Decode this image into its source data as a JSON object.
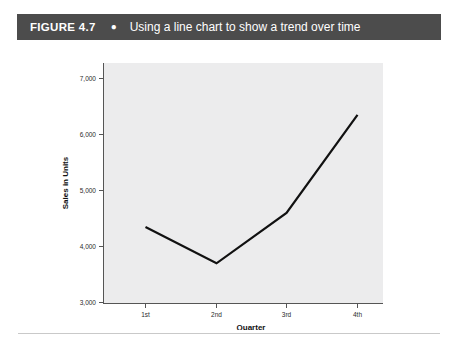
{
  "figure": {
    "label": "FIGURE 4.7",
    "bullet": "●",
    "caption": "Using a line chart to show a trend over time"
  },
  "colors": {
    "header_bar": "#4c4c4c",
    "header_text": "#ffffff",
    "plot_background": "#ececed",
    "line": "#111111",
    "axis": "#555555",
    "rule": "#c9c9c9"
  },
  "chart_data": {
    "type": "line",
    "title": "Using a line chart to show a trend over time",
    "categories": [
      "1st",
      "2nd",
      "3rd",
      "4th"
    ],
    "values": [
      4350,
      3700,
      4600,
      6350
    ],
    "series": [
      {
        "name": "Sales in Units",
        "values": [
          4350,
          3700,
          4600,
          6350
        ]
      }
    ],
    "xlabel": "Quarter",
    "ylabel": "Sales in Units",
    "ylim": [
      3000,
      7000
    ],
    "yticks": [
      3000,
      4000,
      5000,
      6000,
      7000
    ],
    "ytick_labels": [
      "3,000",
      "4,000",
      "5,000",
      "6,000",
      "7,000"
    ],
    "xtick_labels": [
      "1st",
      "2nd",
      "3rd",
      "4th"
    ],
    "grid": false,
    "legend": false,
    "legend_position": "none"
  }
}
